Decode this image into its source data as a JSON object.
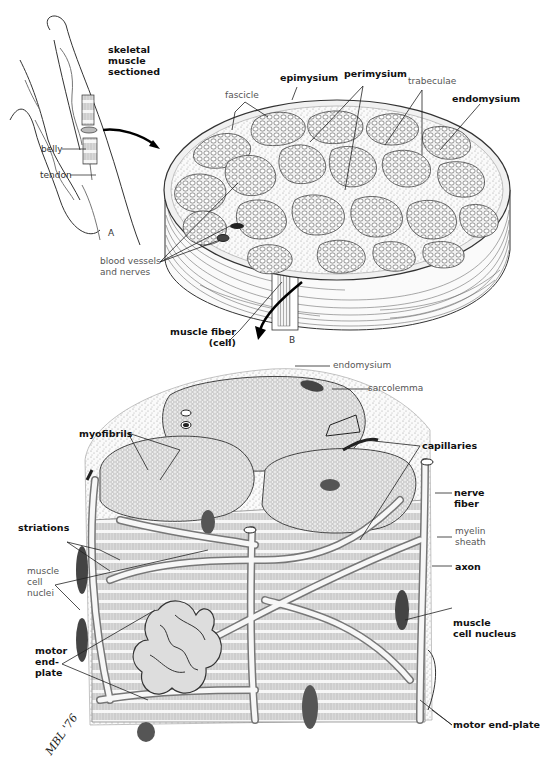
{
  "figure": {
    "panels": {
      "a": "A",
      "b": "B"
    },
    "signature": "MBL '76"
  },
  "panel_a": {
    "title_lines": [
      "skeletal",
      "muscle",
      "sectioned"
    ],
    "labels": {
      "belly": "belly",
      "tendon": "tendon"
    }
  },
  "panel_b": {
    "labels": {
      "fascicle": "fascicle",
      "epimysium": "epimysium",
      "perimysium": "perimysium",
      "trabeculae": "trabeculae",
      "endomysium": "endomysium",
      "blood_vessels_1": "blood vessels",
      "blood_vessels_2": "and nerves",
      "muscle_fiber_1": "muscle fiber",
      "muscle_fiber_2": "(cell)"
    }
  },
  "panel_c": {
    "labels": {
      "endomysium": "endomysium",
      "sarcolemma": "sarcolemma",
      "myofibrils": "myofibrils",
      "capillaries": "capillaries",
      "nerve_fiber_1": "nerve",
      "nerve_fiber_2": "fiber",
      "striations": "striations",
      "myelin_1": "myelin",
      "myelin_2": "sheath",
      "muscle_cell_nuclei_1": "muscle",
      "muscle_cell_nuclei_2": "cell",
      "muscle_cell_nuclei_3": "nuclei",
      "axon": "axon",
      "muscle_cell_nucleus_1": "muscle",
      "muscle_cell_nucleus_2": "cell nucleus",
      "motor_end_plate_left_1": "motor",
      "motor_end_plate_left_2": "end-",
      "motor_end_plate_left_3": "plate",
      "motor_end_plate_right": "motor end-plate"
    }
  }
}
